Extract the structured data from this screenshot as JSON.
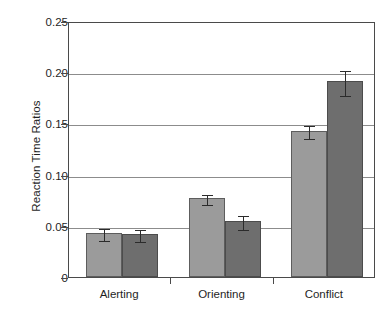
{
  "chart_data": {
    "type": "bar",
    "title": "",
    "xlabel": "",
    "ylabel": "Reaction Time Ratios",
    "categories": [
      "Alerting",
      "Orienting",
      "Conflict"
    ],
    "ylim": [
      0,
      0.25
    ],
    "ytick_labels": [
      "0",
      "0.05",
      "0.10",
      "0.15",
      "0.20",
      "0.25"
    ],
    "ytick_values": [
      0,
      0.05,
      0.1,
      0.15,
      0.2,
      0.25
    ],
    "grid": true,
    "legend": "none",
    "series": [
      {
        "name": "series-1",
        "color": "#9b9b9b",
        "values": [
          0.043,
          0.077,
          0.143
        ],
        "errors": [
          0.006,
          0.005,
          0.006
        ]
      },
      {
        "name": "series-2",
        "color": "#6e6e6e",
        "values": [
          0.042,
          0.055,
          0.191
        ],
        "errors": [
          0.006,
          0.007,
          0.012
        ]
      }
    ]
  }
}
